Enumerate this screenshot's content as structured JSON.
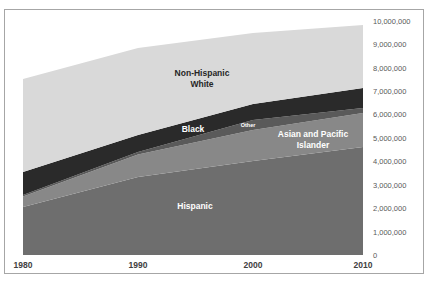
{
  "chart_data": {
    "type": "area",
    "stacked": true,
    "title": "",
    "xlabel": "",
    "ylabel": "",
    "categories": [
      "1980",
      "1990",
      "2000",
      "2010"
    ],
    "x": [
      1980,
      1990,
      2000,
      2010
    ],
    "series": [
      {
        "name": "Hispanic",
        "color": "#6e6e6e",
        "values": [
          2050000,
          3330000,
          4020000,
          4620000
        ]
      },
      {
        "name": "Asian and Pacific Islander",
        "color": "#888888",
        "values": [
          450000,
          970000,
          1320000,
          1450000
        ]
      },
      {
        "name": "Other",
        "color": "#5a5a5a",
        "values": [
          60000,
          100000,
          430000,
          210000
        ]
      },
      {
        "name": "Black",
        "color": "#2a2a2a",
        "values": [
          990000,
          730000,
          680000,
          860000
        ]
      },
      {
        "name": "Non-Hispanic White",
        "color": "#d9d9d9",
        "values": [
          3970000,
          3720000,
          3040000,
          2690000
        ]
      }
    ],
    "ylim": [
      0,
      10000000
    ],
    "yticks": [
      "0",
      "1,000,000",
      "2,000,000",
      "3,000,000",
      "4,000,000",
      "5,000,000",
      "6,000,000",
      "7,000,000",
      "8,000,000",
      "9,000,000",
      "10,000,000"
    ],
    "yaxis_position": "right",
    "grid": false,
    "legend": "none (in-plot series labels)"
  },
  "labels": {
    "white_line1": "Non-Hispanic",
    "white_line2": "White",
    "black": "Black",
    "other": "Other",
    "asian_line1": "Asian and Pacific",
    "asian_line2": "Islander",
    "hispanic": "Hispanic"
  },
  "xaxis": [
    "1980",
    "1990",
    "2000",
    "2010"
  ],
  "yaxis": [
    "10,000,000",
    "9,000,000",
    "8,000,000",
    "7,000,000",
    "6,000,000",
    "5,000,000",
    "4,000,000",
    "3,000,000",
    "2,000,000",
    "1,000,000",
    "0"
  ]
}
